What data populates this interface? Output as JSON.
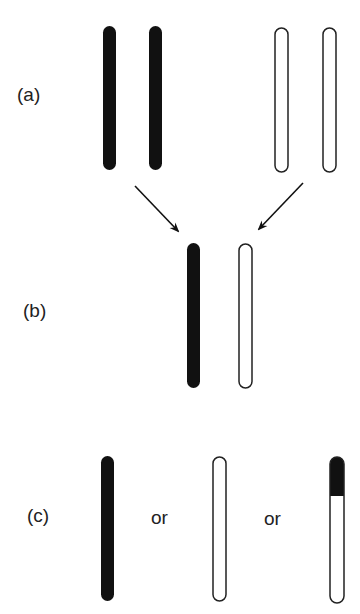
{
  "labels": {
    "a": "(a)",
    "b": "(b)",
    "c": "(c)",
    "or1": "or",
    "or2": "or"
  },
  "colors": {
    "filled": "#111111",
    "outline": "#222222",
    "background": "#ffffff"
  }
}
